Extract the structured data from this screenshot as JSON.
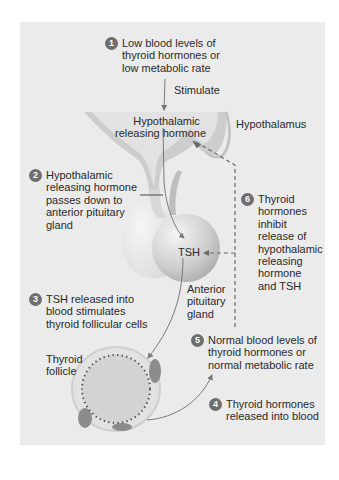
{
  "diagram": {
    "colors": {
      "background": "#ebebeb",
      "tissue": "#d6d6d6",
      "step_badge": "#6e6e6e",
      "arrow": "#7a7a7a"
    },
    "steps": [
      {
        "number": "1",
        "lines": [
          "Low blood levels of",
          "thyroid hormones or",
          "low metabolic rate"
        ]
      },
      {
        "number": "2",
        "lines": [
          "Hypothalamic",
          "releasing hormone",
          "passes down to",
          "anterior pituitary",
          "gland"
        ]
      },
      {
        "number": "3",
        "lines": [
          "TSH released into",
          "blood stimulates",
          "thyroid follicular cells"
        ]
      },
      {
        "number": "4",
        "lines": [
          "Thyroid hormones",
          "released into blood"
        ]
      },
      {
        "number": "5",
        "lines": [
          "Normal blood levels of",
          "thyroid hormones or",
          "normal metabolic rate"
        ]
      },
      {
        "number": "6",
        "lines": [
          "Thyroid",
          "hormones",
          "inhibit",
          "release of",
          "hypothalamic",
          "releasing",
          "hormone",
          "and TSH"
        ]
      }
    ],
    "labels": {
      "stimulate": "Stimulate",
      "hypothalamic_releasing_hormone": [
        "Hypothalamic",
        "releasing hormone"
      ],
      "hypothalamus": "Hypothalamus",
      "tsh": "TSH",
      "anterior_pituitary": [
        "Anterior",
        "pituitary",
        "gland"
      ],
      "thyroid_follicle": [
        "Thyroid",
        "follicle"
      ]
    }
  }
}
